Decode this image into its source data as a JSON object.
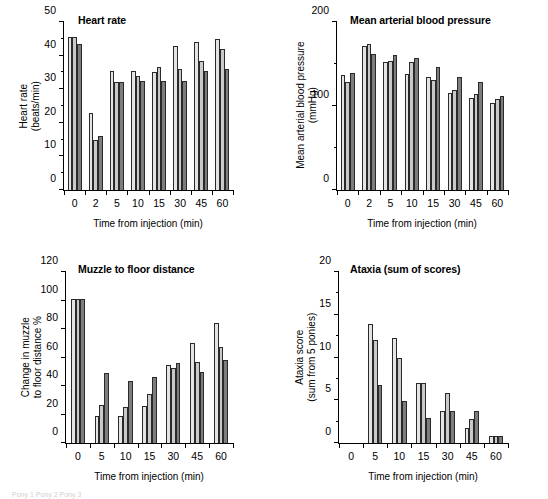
{
  "figure": {
    "series_shades": [
      "#e4e4e4",
      "#c9c9c9",
      "#7d7d7d"
    ],
    "footnote": "Pony 1   Pony 2   Pony 3"
  },
  "chart_data": [
    {
      "type": "bar",
      "panel": "top-left",
      "title": "Heart rate",
      "xlabel": "Time from injection (min)",
      "ylabel": "Heart rate\n(beats/min)",
      "ylabel_line1": "Heart rate",
      "ylabel_line2": "(beats/min)",
      "categories": [
        "0",
        "2",
        "5",
        "10",
        "15",
        "30",
        "45",
        "60"
      ],
      "ylim": [
        0,
        50
      ],
      "yticks": [
        0,
        10,
        20,
        30,
        40,
        50
      ],
      "yticklabels": [
        "0",
        "10",
        "20",
        "30",
        "40",
        "50"
      ],
      "yminorticks": [
        5,
        15,
        25,
        35,
        45
      ],
      "grid": false,
      "legend": "none",
      "series": [
        {
          "name": "series 1",
          "values": [
            45.5,
            23.0,
            35.5,
            35.5,
            35.0,
            43.0,
            44.0,
            45.0
          ]
        },
        {
          "name": "series 2",
          "values": [
            45.5,
            15.0,
            32.0,
            34.0,
            36.5,
            36.0,
            38.5,
            42.0
          ]
        },
        {
          "name": "series 3",
          "values": [
            43.5,
            16.0,
            32.0,
            32.5,
            32.5,
            32.5,
            35.5,
            36.0
          ]
        }
      ]
    },
    {
      "type": "bar",
      "panel": "top-right",
      "title": "Mean arterial blood pressure",
      "xlabel": "Time from injection (min)",
      "ylabel": "Mean arterial blood pressure\n(mmHg)",
      "ylabel_line1": "Mean arterial blood pressure",
      "ylabel_line2": "(mmHg)",
      "categories": [
        "0",
        "2",
        "5",
        "10",
        "15",
        "30",
        "45",
        "60"
      ],
      "ylim": [
        0,
        200
      ],
      "yticks": [
        0,
        100,
        200
      ],
      "yticklabels": [
        "0",
        "100",
        "200"
      ],
      "yminorticks": [
        50,
        150
      ],
      "grid": false,
      "legend": "none",
      "series": [
        {
          "name": "series 1",
          "values": [
            137,
            172,
            152,
            138,
            134,
            116,
            110,
            104
          ]
        },
        {
          "name": "series 2",
          "values": [
            128,
            174,
            154,
            152,
            131,
            119,
            114,
            108
          ]
        },
        {
          "name": "series 3",
          "values": [
            139,
            162,
            161,
            157,
            146,
            134,
            128,
            112
          ]
        }
      ]
    },
    {
      "type": "bar",
      "panel": "bottom-left",
      "title": "Muzzle to floor distance",
      "xlabel": "Time from injection (min)",
      "ylabel": "Change in muzzle\nto floor distance %",
      "ylabel_line1": "Change in muzzle",
      "ylabel_line2": "to floor distance %",
      "categories": [
        "0",
        "5",
        "10",
        "15",
        "30",
        "45",
        "60"
      ],
      "ylim": [
        0,
        120
      ],
      "yticks": [
        0,
        20,
        40,
        60,
        80,
        100,
        120
      ],
      "yticklabels": [
        "0",
        "20",
        "40",
        "60",
        "80",
        "100",
        "120"
      ],
      "yminorticks": [],
      "grid": false,
      "legend": "none",
      "series": [
        {
          "name": "series 1",
          "values": [
            101,
            19.0,
            19.0,
            26.0,
            54.5,
            70.0,
            84.0
          ]
        },
        {
          "name": "series 2",
          "values": [
            101,
            27.0,
            25.0,
            34.5,
            52.5,
            57.0,
            67.5
          ]
        },
        {
          "name": "series 3",
          "values": [
            101,
            49.0,
            43.5,
            46.0,
            56.0,
            49.5,
            58.0
          ]
        }
      ]
    },
    {
      "type": "bar",
      "panel": "bottom-right",
      "title": "Ataxia (sum of scores)",
      "xlabel": "Time from injection (min)",
      "ylabel": "Ataxia score\n(sum from 5 ponies)",
      "ylabel_line1": "Ataxia score",
      "ylabel_line2": "(sum from 5 ponies)",
      "categories": [
        "0",
        "5",
        "10",
        "15",
        "30",
        "45",
        "60"
      ],
      "ylim": [
        0,
        20
      ],
      "yticks": [
        0,
        5,
        10,
        15,
        20
      ],
      "yticklabels": [
        "0",
        "5",
        "10",
        "15",
        "20"
      ],
      "yminorticks": [
        2.5,
        7.5,
        12.5,
        17.5
      ],
      "grid": false,
      "legend": "none",
      "series": [
        {
          "name": "series 1",
          "values": [
            0,
            13.9,
            12.3,
            7.0,
            3.8,
            1.8,
            0.8
          ]
        },
        {
          "name": "series 2",
          "values": [
            0,
            12.0,
            10.0,
            7.0,
            5.9,
            2.8,
            0.8
          ]
        },
        {
          "name": "series 3",
          "values": [
            0,
            6.8,
            4.9,
            2.9,
            3.8,
            3.8,
            0.8
          ]
        }
      ]
    }
  ]
}
